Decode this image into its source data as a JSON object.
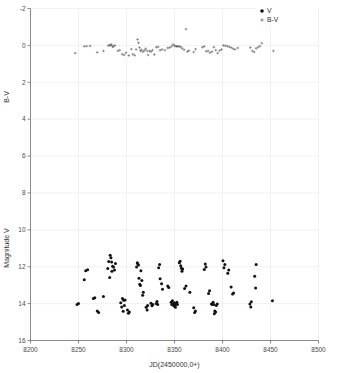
{
  "figure": {
    "title": "",
    "background_color": "#ffffff",
    "width": 337,
    "height": 373
  },
  "axes": {
    "x_label": "JD(2450000,0+)",
    "y_label_top": "B-V",
    "y_label_bottom": "Magnitude V",
    "x_ticks": [
      "8200",
      "8250",
      "8300",
      "8350",
      "8400",
      "8450",
      "8500"
    ],
    "y_ticks": [
      "-2",
      "0",
      "2",
      "4",
      "6",
      "8",
      "10",
      "12",
      "14",
      "16"
    ]
  },
  "legend": {
    "position": "top-right",
    "entries": [
      {
        "marker": "filled-circle-marker",
        "label": "V",
        "color": "#121212"
      },
      {
        "marker": "plus-marker",
        "label": "B-V",
        "color": "#4c4c4c"
      }
    ]
  },
  "chart_data": {
    "type": "scatter",
    "title": "",
    "xlabel": "JD(2450000,0+)",
    "ylabel": "Magnitude V / B-V",
    "xlim": [
      8200,
      8500
    ],
    "ylim": [
      16,
      -2
    ],
    "y_inverted": true,
    "grid": true,
    "xticks": [
      8200,
      8250,
      8300,
      8350,
      8400,
      8450,
      8500
    ],
    "yticks": [
      -2,
      0,
      2,
      4,
      6,
      8,
      10,
      12,
      14,
      16
    ],
    "series": [
      {
        "name": "B-V",
        "marker": "plus",
        "color": "#4c4c4c",
        "points": [
          [
            8246.5,
            0.42
          ],
          [
            8256.0,
            0.05
          ],
          [
            8258.5,
            0.04
          ],
          [
            8262.0,
            0.03
          ],
          [
            8269.5,
            0.38
          ],
          [
            8276.0,
            0.3
          ],
          [
            8281.0,
            0.02
          ],
          [
            8282.5,
            -0.02
          ],
          [
            8283.5,
            0.0
          ],
          [
            8284.5,
            -0.05
          ],
          [
            8285.5,
            0.08
          ],
          [
            8286.5,
            0.05
          ],
          [
            8288.0,
            0.0
          ],
          [
            8291.0,
            0.3
          ],
          [
            8293.0,
            0.26
          ],
          [
            8295.5,
            0.48
          ],
          [
            8297.5,
            0.52
          ],
          [
            8299.5,
            0.4
          ],
          [
            8302.5,
            0.55
          ],
          [
            8305.0,
            0.2
          ],
          [
            8306.5,
            0.48
          ],
          [
            8308.5,
            0.54
          ],
          [
            8310.0,
            0.22
          ],
          [
            8311.5,
            -0.32
          ],
          [
            8312.5,
            -0.14
          ],
          [
            8313.5,
            0.12
          ],
          [
            8314.5,
            0.3
          ],
          [
            8315.5,
            0.24
          ],
          [
            8317.0,
            0.35
          ],
          [
            8318.5,
            0.28
          ],
          [
            8320.0,
            0.18
          ],
          [
            8321.5,
            0.3
          ],
          [
            8322.5,
            0.52
          ],
          [
            8324.0,
            0.3
          ],
          [
            8325.5,
            0.34
          ],
          [
            8327.0,
            0.26
          ],
          [
            8329.0,
            0.5
          ],
          [
            8331.0,
            0.1
          ],
          [
            8333.0,
            0.08
          ],
          [
            8335.0,
            0.26
          ],
          [
            8337.0,
            0.22
          ],
          [
            8340.0,
            0.26
          ],
          [
            8343.0,
            0.14
          ],
          [
            8345.0,
            0.12
          ],
          [
            8347.0,
            0.05
          ],
          [
            8348.5,
            -0.05
          ],
          [
            8350.0,
            0.02
          ],
          [
            8351.5,
            0.04
          ],
          [
            8352.5,
            0.06
          ],
          [
            8353.5,
            0.05
          ],
          [
            8355.0,
            0.06
          ],
          [
            8356.5,
            0.08
          ],
          [
            8358.0,
            0.16
          ],
          [
            8360.0,
            0.24
          ],
          [
            8362.0,
            -0.88
          ],
          [
            8363.5,
            0.34
          ],
          [
            8365.0,
            0.28
          ],
          [
            8370.0,
            0.36
          ],
          [
            8372.0,
            0.2
          ],
          [
            8379.0,
            0.1
          ],
          [
            8381.0,
            0.06
          ],
          [
            8383.0,
            0.32
          ],
          [
            8385.0,
            0.3
          ],
          [
            8387.0,
            0.4
          ],
          [
            8389.0,
            0.34
          ],
          [
            8391.0,
            0.1
          ],
          [
            8393.0,
            0.26
          ],
          [
            8395.0,
            0.42
          ],
          [
            8397.0,
            0.28
          ],
          [
            8399.0,
            0.22
          ],
          [
            8401.0,
            0.0
          ],
          [
            8403.0,
            0.02
          ],
          [
            8405.0,
            0.04
          ],
          [
            8407.0,
            0.08
          ],
          [
            8409.0,
            0.12
          ],
          [
            8411.0,
            0.18
          ],
          [
            8413.0,
            0.22
          ],
          [
            8416.0,
            0.14
          ],
          [
            8429.0,
            0.12
          ],
          [
            8431.0,
            0.3
          ],
          [
            8433.0,
            0.36
          ],
          [
            8435.0,
            0.16
          ],
          [
            8437.0,
            0.1
          ],
          [
            8439.0,
            0.04
          ],
          [
            8441.0,
            -0.12
          ],
          [
            8453.0,
            0.3
          ]
        ]
      },
      {
        "name": "V",
        "marker": "circle",
        "color": "#121212",
        "points": [
          [
            8248.5,
            14.05
          ],
          [
            8250.0,
            14.0
          ],
          [
            8256.0,
            12.7
          ],
          [
            8257.5,
            12.22
          ],
          [
            8259.5,
            12.16
          ],
          [
            8265.5,
            13.72
          ],
          [
            8267.0,
            13.68
          ],
          [
            8269.5,
            14.4
          ],
          [
            8271.0,
            14.48
          ],
          [
            8276.0,
            13.62
          ],
          [
            8280.5,
            12.1
          ],
          [
            8281.5,
            11.72
          ],
          [
            8282.5,
            12.58
          ],
          [
            8283.0,
            11.38
          ],
          [
            8283.8,
            11.52
          ],
          [
            8284.5,
            11.75
          ],
          [
            8284.8,
            12.25
          ],
          [
            8285.5,
            11.98
          ],
          [
            8286.5,
            12.02
          ],
          [
            8287.5,
            12.18
          ],
          [
            8288.5,
            11.82
          ],
          [
            8294.0,
            13.95
          ],
          [
            8295.0,
            14.18
          ],
          [
            8295.8,
            13.72
          ],
          [
            8296.5,
            14.42
          ],
          [
            8297.0,
            13.82
          ],
          [
            8297.8,
            14.1
          ],
          [
            8298.5,
            13.8
          ],
          [
            8301.0,
            14.35
          ],
          [
            8302.0,
            14.52
          ],
          [
            8303.0,
            14.45
          ],
          [
            8310.5,
            12.02
          ],
          [
            8311.2,
            11.78
          ],
          [
            8311.8,
            11.85
          ],
          [
            8312.5,
            11.9
          ],
          [
            8313.0,
            12.62
          ],
          [
            8313.8,
            12.95
          ],
          [
            8314.5,
            13.02
          ],
          [
            8315.0,
            12.22
          ],
          [
            8316.0,
            12.75
          ],
          [
            8316.8,
            13.55
          ],
          [
            8317.5,
            13.38
          ],
          [
            8320.5,
            14.2
          ],
          [
            8321.5,
            14.35
          ],
          [
            8322.0,
            14.1
          ],
          [
            8325.5,
            13.98
          ],
          [
            8326.5,
            14.12
          ],
          [
            8327.5,
            14.05
          ],
          [
            8331.0,
            14.0
          ],
          [
            8331.8,
            13.88
          ],
          [
            8332.5,
            14.05
          ],
          [
            8333.5,
            12.05
          ],
          [
            8334.5,
            11.88
          ],
          [
            8335.0,
            12.65
          ],
          [
            8336.5,
            12.92
          ],
          [
            8337.5,
            13.22
          ],
          [
            8343.0,
            13.05
          ],
          [
            8344.0,
            13.12
          ],
          [
            8346.5,
            13.92
          ],
          [
            8347.2,
            14.05
          ],
          [
            8347.8,
            13.85
          ],
          [
            8348.5,
            14.02
          ],
          [
            8349.2,
            14.12
          ],
          [
            8349.8,
            13.95
          ],
          [
            8350.5,
            14.08
          ],
          [
            8351.0,
            14.2
          ],
          [
            8351.8,
            14.0
          ],
          [
            8352.5,
            13.92
          ],
          [
            8353.0,
            14.05
          ],
          [
            8355.0,
            11.78
          ],
          [
            8355.8,
            11.7
          ],
          [
            8356.5,
            11.95
          ],
          [
            8357.2,
            12.08
          ],
          [
            8357.8,
            12.25
          ],
          [
            8358.5,
            12.12
          ],
          [
            8360.5,
            13.18
          ],
          [
            8362.0,
            13.05
          ],
          [
            8366.0,
            13.38
          ],
          [
            8370.0,
            14.22
          ],
          [
            8371.0,
            14.48
          ],
          [
            8371.8,
            14.4
          ],
          [
            8381.0,
            12.15
          ],
          [
            8382.0,
            11.85
          ],
          [
            8382.8,
            12.02
          ],
          [
            8385.5,
            13.45
          ],
          [
            8386.5,
            13.3
          ],
          [
            8388.5,
            14.02
          ],
          [
            8389.5,
            14.05
          ],
          [
            8390.2,
            13.92
          ],
          [
            8390.8,
            14.05
          ],
          [
            8391.5,
            14.55
          ],
          [
            8392.0,
            14.4
          ],
          [
            8392.8,
            14.45
          ],
          [
            8393.5,
            14.1
          ],
          [
            8394.5,
            14.02
          ],
          [
            8400.5,
            11.68
          ],
          [
            8401.5,
            12.05
          ],
          [
            8402.5,
            11.88
          ],
          [
            8405.5,
            12.35
          ],
          [
            8406.5,
            12.18
          ],
          [
            8409.0,
            13.1
          ],
          [
            8410.5,
            13.48
          ],
          [
            8411.5,
            13.42
          ],
          [
            8428.5,
            14.02
          ],
          [
            8429.5,
            14.18
          ],
          [
            8430.0,
            13.9
          ],
          [
            8433.5,
            12.52
          ],
          [
            8434.5,
            13.15
          ],
          [
            8435.0,
            11.88
          ],
          [
            8452.0,
            13.85
          ]
        ]
      }
    ]
  }
}
